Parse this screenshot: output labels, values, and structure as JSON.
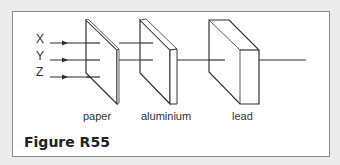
{
  "diagram": {
    "rays": [
      {
        "label": "X"
      },
      {
        "label": "Y"
      },
      {
        "label": "Z"
      }
    ],
    "materials": [
      {
        "label": "paper"
      },
      {
        "label": "aluminium"
      },
      {
        "label": "lead"
      }
    ],
    "caption": "Figure R55",
    "colors": {
      "background": "#ebebeb",
      "panel": "#ffffff",
      "line": "#333333"
    }
  }
}
